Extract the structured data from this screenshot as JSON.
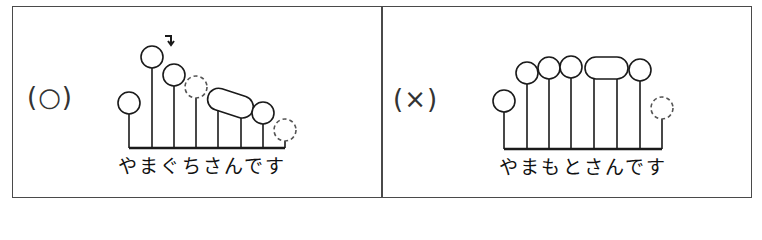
{
  "panels": [
    {
      "id": "correct",
      "label": "(○)",
      "sentence": "やまぐちさんです",
      "morae": [
        "や",
        "ま",
        "ぐ",
        "ち",
        "さ",
        "ん",
        "で",
        "す"
      ],
      "pitch_pattern": "low-high(peak)-falling",
      "accent_mark": "↴",
      "devoiced_morae": [
        3,
        7
      ],
      "joined_morae": [
        4,
        5
      ]
    },
    {
      "id": "incorrect",
      "label": "(×)",
      "sentence": "やまもとさんです",
      "morae": [
        "や",
        "ま",
        "も",
        "と",
        "さ",
        "ん",
        "で",
        "す"
      ],
      "pitch_pattern": "low-high-flat",
      "devoiced_morae": [
        7
      ],
      "joined_morae": [
        4,
        5
      ]
    }
  ],
  "colors": {
    "line": "#1a1a1a",
    "frame": "#4a4a4a",
    "label": "#333333"
  }
}
